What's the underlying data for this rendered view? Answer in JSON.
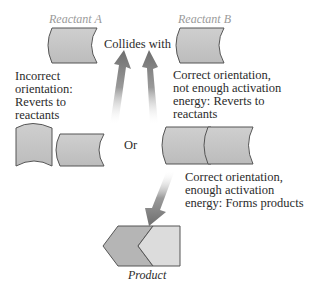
{
  "diagram": {
    "reactant_a": {
      "label": "Reactant A"
    },
    "reactant_b": {
      "label": "Reactant B"
    },
    "collides_label": "Collides with",
    "or_label": "Or",
    "product": {
      "label": "Product"
    },
    "outcomes": {
      "incorrect": [
        "Incorrect",
        "orientation:",
        "Reverts to",
        "reactants"
      ],
      "not_enough": [
        "Correct orientation,",
        "not enough activation",
        "energy: Reverts to",
        "reactants"
      ],
      "enough": [
        "Correct orientation,",
        "enough activation",
        "energy: Forms products"
      ]
    },
    "colors": {
      "shape_fill": "#c4c4c4",
      "shape_stroke": "#555555",
      "arrow": "#7a7a7a",
      "label_gray": "#9a9a9a",
      "text": "#2b2b2b"
    }
  }
}
